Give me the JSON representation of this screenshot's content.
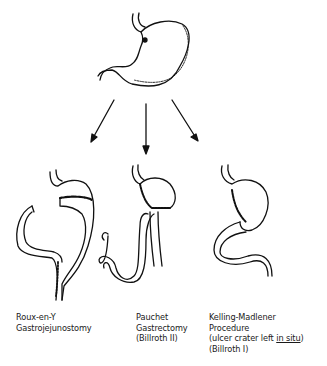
{
  "diagram": {
    "source_node": {
      "name": "stomach",
      "icon": "stomach-illustration"
    },
    "arrows": 3,
    "procedures": [
      {
        "lines": [
          "Roux-en-Y",
          "Gastrojejunostomy"
        ]
      },
      {
        "lines": [
          "Pauchet",
          "Gastrectomy",
          "(Billroth II)"
        ]
      },
      {
        "lines": [
          "Kelling-Madlener",
          "Procedure",
          "(ulcer crater left ",
          "in situ",
          ")",
          "(Billroth I)"
        ]
      }
    ]
  }
}
